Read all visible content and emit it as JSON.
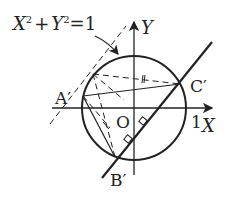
{
  "diagram": {
    "equation": {
      "x": "X",
      "sup1": "2",
      "plus": "+",
      "y": "Y",
      "sup2": "2",
      "eq": "=1"
    },
    "axes": {
      "x_label": "X",
      "y_label": "Y",
      "origin_label": "O",
      "tick_label": "1"
    },
    "points": {
      "a": "A′",
      "b": "B′",
      "c": "C′"
    },
    "colors": {
      "stroke": "#222222",
      "background": "#ffffff"
    }
  }
}
